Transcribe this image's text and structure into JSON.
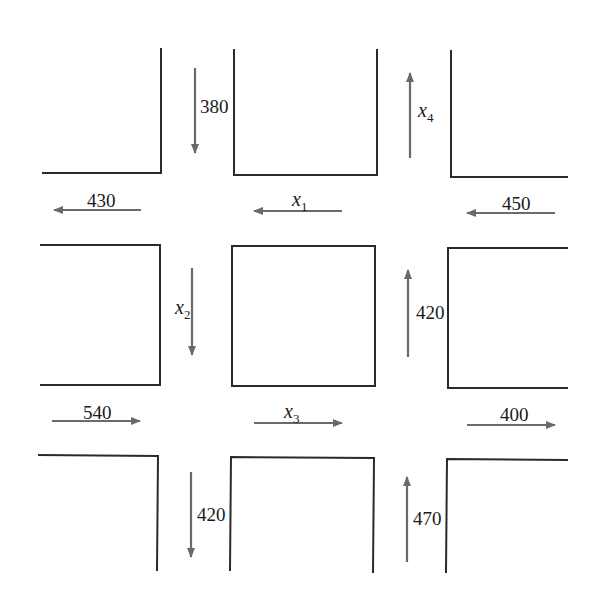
{
  "diagram": {
    "type": "traffic-flow-network",
    "colors": {
      "block_outline": "#2a2a2a",
      "arrow": "#6a6a6a",
      "text": "#1a1a1a",
      "background": "#ffffff"
    },
    "flows": {
      "top_left_inflow": {
        "value": "380",
        "direction": "down"
      },
      "left_top_outflow": {
        "value": "430",
        "direction": "left"
      },
      "x1": {
        "var": "x",
        "sub": "1",
        "direction": "left"
      },
      "right_top_inflow": {
        "value": "450",
        "direction": "left"
      },
      "x4": {
        "var": "x",
        "sub": "4",
        "direction": "up"
      },
      "x2": {
        "var": "x",
        "sub": "2",
        "direction": "down"
      },
      "right_middle_up": {
        "value": "420",
        "direction": "up"
      },
      "left_bottom_inflow": {
        "value": "540",
        "direction": "right"
      },
      "x3": {
        "var": "x",
        "sub": "3",
        "direction": "right"
      },
      "right_bottom_outflow": {
        "value": "400",
        "direction": "right"
      },
      "bottom_left_outflow": {
        "value": "420",
        "direction": "down"
      },
      "bottom_right_inflow": {
        "value": "470",
        "direction": "up"
      }
    }
  }
}
